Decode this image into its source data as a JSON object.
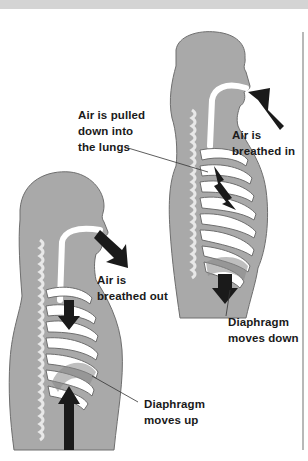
{
  "figure": {
    "labels": {
      "pulled": [
        "Air is pulled",
        "down into",
        "the lungs"
      ],
      "breathed_in": [
        "Air is",
        "breathed in"
      ],
      "breathed_out": [
        "Air is",
        "breathed out"
      ],
      "diaphragm_down": [
        "Diaphragm",
        "moves down"
      ],
      "diaphragm_up": [
        "Diaphragm",
        "moves up"
      ]
    },
    "colors": {
      "body": "#a9a9a9",
      "body_light": "#c8c8c8",
      "rib": "#bdbdbd",
      "arrow": "#1a1a1a",
      "airway": "#ffffff",
      "band": "#d4d4d4"
    }
  }
}
